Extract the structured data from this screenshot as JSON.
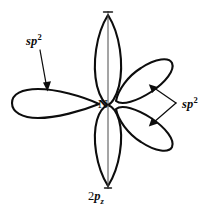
{
  "figure": {
    "type": "orbital-hybridization-diagram",
    "background_color": "#ffffff",
    "stroke_color": "#0d0d0d"
  },
  "atom": {
    "symbol": "N",
    "name": "nitrogen-center-label"
  },
  "labels": {
    "sp2_left": {
      "base": "sp",
      "exponent": "2"
    },
    "sp2_right": {
      "base": "sp",
      "exponent": "2"
    },
    "p_orbital": {
      "prefix": "2",
      "base": "p",
      "subscript": "z"
    }
  },
  "orbitals": [
    {
      "id": "p-lobe-top",
      "kind": "2pz",
      "shape": "teardrop",
      "direction": "up",
      "angle_deg": 90,
      "has_axis_line": true
    },
    {
      "id": "p-lobe-bottom",
      "kind": "2pz",
      "shape": "teardrop",
      "direction": "down",
      "angle_deg": 270,
      "has_axis_line": true
    },
    {
      "id": "sp2-lobe-left",
      "kind": "sp2",
      "shape": "teardrop",
      "direction": "left",
      "angle_deg": 180,
      "has_axis_line": false
    },
    {
      "id": "sp2-lobe-upper-right",
      "kind": "sp2",
      "shape": "ellipse",
      "direction": "upper-right",
      "angle_deg": 28,
      "has_axis_line": false
    },
    {
      "id": "sp2-lobe-lower-right",
      "kind": "sp2",
      "shape": "ellipse",
      "direction": "lower-right",
      "angle_deg": -28,
      "has_axis_line": false
    }
  ],
  "annotations": [
    {
      "id": "leader-left",
      "from_label": "sp2_left",
      "to_orbital": "sp2-lobe-left",
      "arrowhead": true
    },
    {
      "id": "leader-right-upper",
      "from_label": "sp2_right",
      "to_orbital": "sp2-lobe-upper-right",
      "arrowhead": true
    },
    {
      "id": "leader-right-lower",
      "from_label": "sp2_right",
      "to_orbital": "sp2-lobe-lower-right",
      "arrowhead": true
    },
    {
      "id": "leader-pz",
      "from_label": "p_orbital",
      "to_orbital": "p-lobe-bottom",
      "arrowhead": false
    }
  ]
}
